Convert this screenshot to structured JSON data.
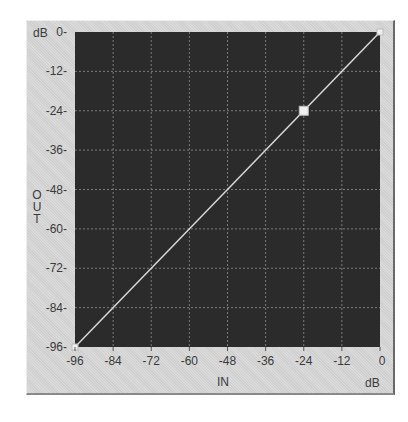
{
  "chart_data": {
    "type": "line",
    "title": "",
    "xlabel": "IN",
    "xunit": "dB",
    "ylabel": "OUT",
    "yunit": "dB",
    "xlim": [
      -96,
      0
    ],
    "ylim": [
      -96,
      0
    ],
    "grid": true,
    "x_ticks": [
      "-96",
      "-84",
      "-72",
      "-60",
      "-48",
      "-36",
      "-24",
      "-12",
      "0"
    ],
    "y_ticks": [
      "0",
      "-12",
      "-24",
      "-36",
      "-48",
      "-60",
      "-72",
      "-84",
      "-96"
    ],
    "series": [
      {
        "name": "transfer-curve",
        "x": [
          -96,
          -24,
          0
        ],
        "y": [
          -96,
          -24,
          0
        ]
      }
    ],
    "control_points": [
      {
        "x": -96,
        "y": -96
      },
      {
        "x": -24,
        "y": -24,
        "selected": true
      },
      {
        "x": 0,
        "y": 0
      }
    ]
  },
  "labels": {
    "y_unit": "dB",
    "x_unit": "dB",
    "x_title": "IN",
    "y_title_letters": [
      "O",
      "U",
      "T"
    ]
  },
  "colors": {
    "plot_bg": "#2b2b2b",
    "grid": "#7a7a7a",
    "line": "#d8d8d8",
    "panel_bg": "#d6d6d6",
    "handle": "#f0f0f0"
  }
}
